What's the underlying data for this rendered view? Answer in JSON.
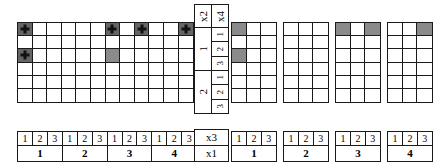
{
  "legend": {
    "plus_marker": "plus-marker",
    "shaded_marker": "shaded-cell"
  },
  "left_grid": {
    "name": "left-factor-grid",
    "columns": 12,
    "rows": 6,
    "cells": [
      {
        "r": 1,
        "c": 1,
        "state": "plus"
      },
      {
        "r": 1,
        "c": 7,
        "state": "plus"
      },
      {
        "r": 1,
        "c": 9,
        "state": "plus"
      },
      {
        "r": 1,
        "c": 12,
        "state": "plus"
      },
      {
        "r": 3,
        "c": 1,
        "state": "plus"
      },
      {
        "r": 3,
        "c": 7,
        "state": "shaded"
      }
    ]
  },
  "left_labels": [
    {
      "sub": [
        "1",
        "2",
        "3"
      ],
      "group": "1"
    },
    {
      "sub": [
        "1",
        "2",
        "3"
      ],
      "group": "2"
    },
    {
      "sub": [
        "1",
        "2",
        "3"
      ],
      "group": "3"
    },
    {
      "sub": [
        "1",
        "2",
        "3"
      ],
      "group": "4"
    }
  ],
  "middle_panel": {
    "headers": [
      "x2",
      "x4"
    ],
    "blocks": [
      {
        "label": "1",
        "sub": [
          "1",
          "2",
          "3"
        ]
      },
      {
        "label": "2",
        "sub": [
          "1",
          "2",
          "3"
        ]
      }
    ]
  },
  "multiplier_box": {
    "top": "x3",
    "bottom": "x1"
  },
  "right_grids": [
    {
      "name": "right-grid-1",
      "columns": 3,
      "rows": 6,
      "cells": [
        {
          "r": 1,
          "c": 1,
          "state": "shaded"
        },
        {
          "r": 3,
          "c": 1,
          "state": "shaded"
        }
      ]
    },
    {
      "name": "right-grid-2",
      "columns": 3,
      "rows": 6,
      "cells": []
    },
    {
      "name": "right-grid-3",
      "columns": 3,
      "rows": 6,
      "cells": [
        {
          "r": 1,
          "c": 1,
          "state": "shaded"
        },
        {
          "r": 1,
          "c": 3,
          "state": "shaded"
        }
      ]
    },
    {
      "name": "right-grid-4",
      "columns": 3,
      "rows": 6,
      "cells": [
        {
          "r": 1,
          "c": 3,
          "state": "shaded"
        }
      ]
    }
  ],
  "right_labels": [
    {
      "sub": [
        "1",
        "2",
        "3"
      ],
      "group": "1"
    },
    {
      "sub": [
        "1",
        "2",
        "3"
      ],
      "group": "2"
    },
    {
      "sub": [
        "1",
        "2",
        "3"
      ],
      "group": "3"
    },
    {
      "sub": [
        "1",
        "2",
        "3"
      ],
      "group": "4"
    }
  ],
  "colors": {
    "line": "#1a1a1a",
    "shaded": "#8a8a8a",
    "dark": "#666666",
    "background": "#ffffff"
  }
}
